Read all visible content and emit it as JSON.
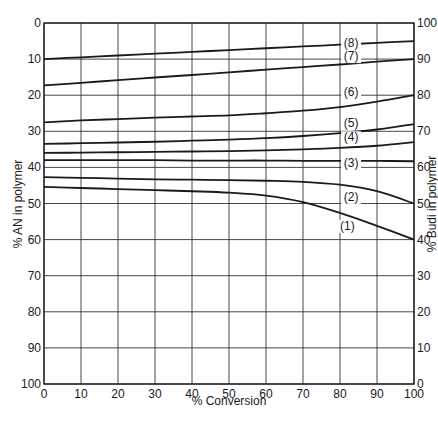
{
  "chart_data": {
    "type": "line",
    "title": "",
    "xlabel": "% Conversion",
    "ylabel": "% AN in polymer",
    "ylabel_right": "% Budi in polymer",
    "xlim": [
      0,
      100
    ],
    "ylim": [
      0,
      100
    ],
    "y_inverted": true,
    "right_axis": {
      "ylim": [
        100,
        0
      ],
      "relation": "Budi = 100 - AN"
    },
    "grid": true,
    "x_ticks": [
      0,
      10,
      20,
      30,
      40,
      50,
      60,
      70,
      80,
      90,
      100
    ],
    "y_ticks": [
      0,
      10,
      20,
      30,
      40,
      50,
      60,
      70,
      80,
      90,
      100
    ],
    "y_right_ticks": [
      100,
      90,
      80,
      70,
      60,
      50,
      40,
      30,
      20,
      10,
      0
    ],
    "x": [
      0,
      10,
      20,
      30,
      40,
      50,
      60,
      70,
      80,
      90,
      100
    ],
    "series": [
      {
        "name": "(1)",
        "values": [
          45.4,
          45.7,
          46.0,
          46.3,
          46.6,
          47.0,
          47.8,
          49.6,
          52.6,
          56.2,
          60.0
        ],
        "label_at": [
          82,
          57
        ]
      },
      {
        "name": "(2)",
        "values": [
          42.7,
          42.9,
          43.1,
          43.3,
          43.4,
          43.5,
          43.7,
          44.0,
          44.8,
          46.6,
          50.0
        ],
        "label_at": [
          83,
          49
        ]
      },
      {
        "name": "(3)",
        "values": [
          38.0,
          38.0,
          38.0,
          38.0,
          38.1,
          38.1,
          38.1,
          38.2,
          38.2,
          38.2,
          38.3
        ],
        "label_at": [
          83,
          39.5
        ]
      },
      {
        "name": "(4)",
        "values": [
          36.0,
          35.9,
          35.8,
          35.7,
          35.6,
          35.5,
          35.3,
          35.0,
          34.6,
          34.0,
          33.0
        ],
        "label_at": [
          83,
          32.5
        ]
      },
      {
        "name": "(5)",
        "values": [
          33.5,
          33.3,
          33.1,
          32.9,
          32.6,
          32.3,
          31.9,
          31.3,
          30.5,
          29.5,
          28.0
        ],
        "label_at": [
          83,
          28.5
        ]
      },
      {
        "name": "(6)",
        "values": [
          27.5,
          27.0,
          26.6,
          26.2,
          25.9,
          25.6,
          25.0,
          24.3,
          23.3,
          21.8,
          20.0
        ],
        "label_at": [
          83,
          20
        ]
      },
      {
        "name": "(7)",
        "values": [
          17.3,
          16.6,
          15.8,
          15.1,
          14.4,
          13.7,
          12.9,
          12.2,
          11.5,
          10.7,
          10.0
        ],
        "label_at": [
          83,
          10
        ]
      },
      {
        "name": "(8)",
        "values": [
          10.0,
          9.5,
          9.0,
          8.5,
          8.0,
          7.5,
          7.0,
          6.5,
          6.0,
          5.5,
          5.0
        ],
        "label_at": [
          83,
          6.5
        ]
      }
    ],
    "colors": {
      "line": "#1a1a1a",
      "grid": "#333333",
      "background": "#ffffff"
    }
  }
}
